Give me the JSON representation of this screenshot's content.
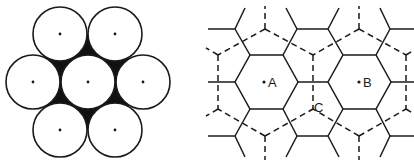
{
  "figure": {
    "colors": {
      "stroke": "#1a1a1a",
      "fill_interstitial": "#111111",
      "background": "#ffffff"
    },
    "left_panel": {
      "description": "Hexagonal close packing of seven circles with dark interstitial voids",
      "circle_radius": 27,
      "circles": [
        {
          "cx": 60,
          "cy": 34
        },
        {
          "cx": 115,
          "cy": 34
        },
        {
          "cx": 33,
          "cy": 82
        },
        {
          "cx": 88,
          "cy": 82
        },
        {
          "cx": 143,
          "cy": 82
        },
        {
          "cx": 60,
          "cy": 130
        },
        {
          "cx": 115,
          "cy": 130
        }
      ]
    },
    "right_panel": {
      "description": "Two interpenetrating hexagonal networks: solid and dashed",
      "labels": [
        {
          "id": "A",
          "text": "A",
          "dot_x": 265,
          "dot_y": 82
        },
        {
          "id": "B",
          "text": "B",
          "dot_x": 359,
          "dot_y": 82
        },
        {
          "id": "C",
          "text": "C",
          "dot_x": 313,
          "dot_y": 109
        }
      ]
    }
  }
}
